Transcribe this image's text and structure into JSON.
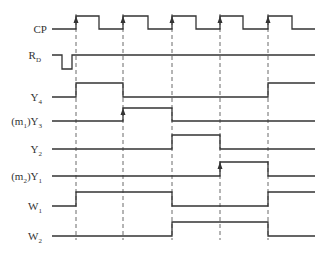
{
  "diagram": {
    "type": "timing-diagram",
    "clock_rising_edges_x": [
      76,
      123,
      172,
      220,
      268
    ],
    "signals": [
      {
        "id": "cp",
        "label": "CP",
        "main": "CP",
        "sub": "",
        "prefix": ""
      },
      {
        "id": "rd",
        "label": "R_D",
        "main": "R",
        "sub": "D",
        "prefix": ""
      },
      {
        "id": "y4",
        "label": "Y_4",
        "main": "Y",
        "sub": "4",
        "prefix": ""
      },
      {
        "id": "y3",
        "label": "(m_1)Y_3",
        "main": "Y",
        "sub": "3",
        "prefix": "(m",
        "prefix_sub": "1",
        "prefix_end": ")"
      },
      {
        "id": "y2",
        "label": "Y_2",
        "main": "Y",
        "sub": "2",
        "prefix": ""
      },
      {
        "id": "y1",
        "label": "(m_2)Y_1",
        "main": "Y",
        "sub": "1",
        "prefix": "(m",
        "prefix_sub": "2",
        "prefix_end": ")"
      },
      {
        "id": "w1",
        "label": "W_1",
        "main": "W",
        "sub": "1",
        "prefix": ""
      },
      {
        "id": "w2",
        "label": "W_2",
        "main": "W",
        "sub": "2",
        "prefix": ""
      }
    ]
  }
}
